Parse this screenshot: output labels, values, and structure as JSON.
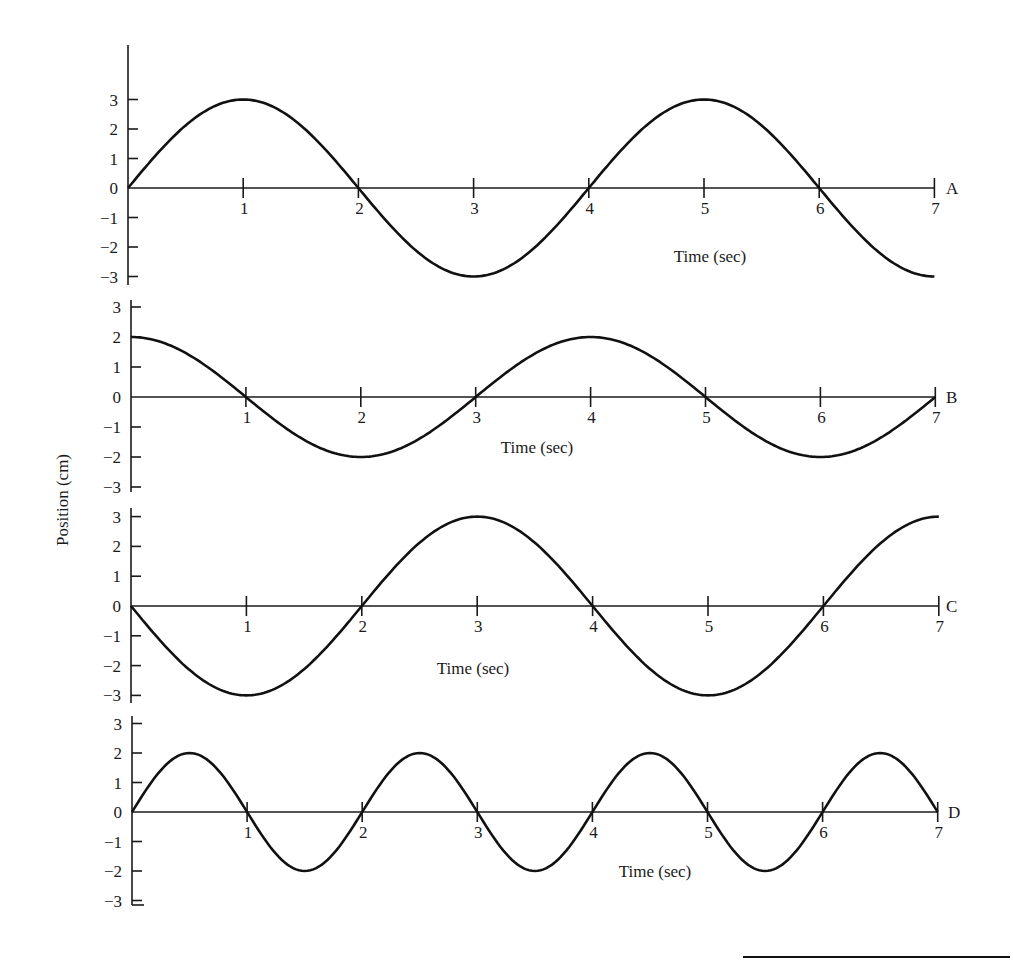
{
  "chart_data": {
    "type": "line",
    "title": "",
    "ylabel": "Position (cm)",
    "xlabel": "Time (sec)",
    "x_ticks": [
      1,
      2,
      3,
      4,
      5,
      6,
      7
    ],
    "y_ticks": [
      3,
      2,
      1,
      0,
      -1,
      -2,
      -3
    ],
    "y_tick_labels": [
      "3",
      "2",
      "1",
      "0",
      "−1",
      "−2",
      "−3"
    ],
    "xlim": [
      0,
      7
    ],
    "ylim": [
      -3,
      3
    ],
    "grid": false,
    "panels": [
      {
        "name": "A",
        "formula": "3 sin(pi t / 2)",
        "amplitude": 3,
        "angular_freq": 1.5708,
        "phase": "sin",
        "sign": 1,
        "x": [
          0,
          1,
          2,
          3,
          4,
          5,
          6,
          7
        ],
        "y": [
          0,
          3,
          0,
          -3,
          0,
          3,
          0,
          -3
        ],
        "time_label": "Time (sec)"
      },
      {
        "name": "B",
        "formula": "2 cos(pi t / 2)",
        "amplitude": 2,
        "angular_freq": 1.5708,
        "phase": "cos",
        "sign": 1,
        "x": [
          0,
          1,
          2,
          3,
          4,
          5,
          6,
          7
        ],
        "y": [
          2,
          0,
          -2,
          0,
          2,
          0,
          -2,
          0
        ],
        "time_label": "Time (sec)"
      },
      {
        "name": "C",
        "formula": "-3 sin(pi t / 2)",
        "amplitude": 3,
        "angular_freq": 1.5708,
        "phase": "sin",
        "sign": -1,
        "x": [
          0,
          1,
          2,
          3,
          4,
          5,
          6,
          7
        ],
        "y": [
          0,
          -3,
          0,
          3,
          0,
          -3,
          0,
          3
        ],
        "time_label": "Time (sec)"
      },
      {
        "name": "D",
        "formula": "2 sin(pi t)",
        "amplitude": 2,
        "angular_freq": 3.1416,
        "phase": "sin",
        "sign": 1,
        "x": [
          0,
          0.5,
          1,
          1.5,
          2,
          2.5,
          3,
          3.5,
          4,
          4.5,
          5,
          5.5,
          6,
          6.5,
          7
        ],
        "y": [
          0,
          2,
          0,
          -2,
          0,
          2,
          0,
          -2,
          0,
          2,
          0,
          -2,
          0,
          2,
          0
        ],
        "time_label": "Time (sec)"
      }
    ]
  },
  "layout": {
    "panels": [
      {
        "x0": 128,
        "y0": 188,
        "unit_x": 115.2,
        "unit_y": 29.5,
        "axis_top": 45,
        "axis_bottom": 285,
        "time_label_x": 710,
        "time_label_y": 262,
        "letter_x": 946
      },
      {
        "x0": 131,
        "y0": 397,
        "unit_x": 114.9,
        "unit_y": 30,
        "axis_top": 300,
        "axis_bottom": 492,
        "time_label_x": 537,
        "time_label_y": 453,
        "letter_x": 946
      },
      {
        "x0": 131,
        "y0": 606,
        "unit_x": 115.4,
        "unit_y": 29.8,
        "axis_top": 508,
        "axis_bottom": 703,
        "time_label_x": 473,
        "time_label_y": 674,
        "letter_x": 946
      },
      {
        "x0": 132,
        "y0": 812,
        "unit_x": 115.1,
        "unit_y": 29.5,
        "axis_top": 716,
        "axis_bottom": 905,
        "time_label_x": 655,
        "time_label_y": 877,
        "letter_x": 948
      }
    ],
    "ylabel_x": 68,
    "ylabel_y": 500,
    "footer_rule": {
      "x1": 743,
      "x2": 1010,
      "y": 957
    }
  }
}
